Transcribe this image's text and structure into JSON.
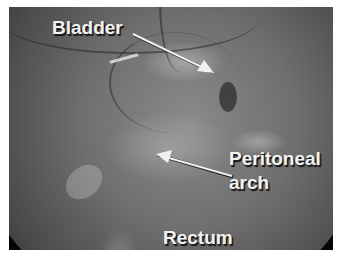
{
  "image": {
    "description": "Grayscale laparoscopic view of pelvic cavity with labeled anatomy",
    "labels": [
      {
        "id": "bladder",
        "text": "Bladder"
      },
      {
        "id": "peritoneal",
        "text": "Peritoneal"
      },
      {
        "id": "arch",
        "text": "arch"
      },
      {
        "id": "rectum",
        "text": "Rectum"
      }
    ]
  },
  "annotations": {
    "bladder": {
      "text": "Bladder",
      "arrow": {
        "from": [
          133,
          34
        ],
        "to": [
          214,
          73
        ]
      }
    },
    "peritoneal_arch": {
      "line1": "Peritoneal",
      "line2": "arch",
      "arrow": {
        "from": [
          232,
          176
        ],
        "to": [
          156,
          154
        ]
      }
    },
    "rectum": {
      "text": "Rectum"
    }
  },
  "colors": {
    "label_text": "#f2f2f2",
    "arrow": "#f0f0f0",
    "border": "#ffffff"
  }
}
